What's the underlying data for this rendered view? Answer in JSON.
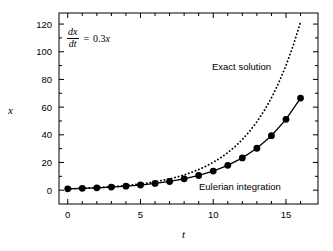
{
  "chart_data": {
    "type": "line",
    "title": "",
    "xlabel": "t",
    "ylabel": "x",
    "xlim": [
      -0.6,
      17.2
    ],
    "ylim": [
      -10,
      128
    ],
    "xticks": [
      0,
      5,
      10,
      15
    ],
    "yticks": [
      0,
      20,
      40,
      60,
      80,
      100,
      120
    ],
    "xtick_labels": [
      "0",
      "5",
      "10",
      "15"
    ],
    "ytick_labels": [
      "0",
      "20",
      "40",
      "60",
      "80",
      "100",
      "120"
    ],
    "xminor_step": 1,
    "yminor_step": 10,
    "grid": false,
    "legend_position": "inline-annotations",
    "equation": {
      "numerator": "dx",
      "denominator": "dt",
      "equals": "=",
      "rhs_coefficient": "0.3",
      "rhs_variable": "x",
      "full_text": "dx/dt = 0.3x"
    },
    "annotations": [
      {
        "name": "exact-solution",
        "text": "Exact solution",
        "x_data": 12.0,
        "y_data": 96
      },
      {
        "name": "eulerian-integration",
        "text": "Eulerian integration",
        "x_data": 10.6,
        "y_data": 8
      }
    ],
    "series": [
      {
        "name": "Eulerian integration",
        "style": "solid-line-with-filled-circle-markers",
        "color": "#000000",
        "x": [
          0,
          1,
          2,
          3,
          4,
          5,
          6,
          7,
          8,
          9,
          10,
          11,
          12,
          13,
          14,
          15,
          16
        ],
        "values": [
          1.0,
          1.3,
          1.69,
          2.2,
          2.86,
          3.71,
          4.83,
          6.27,
          8.16,
          10.6,
          13.79,
          17.92,
          23.3,
          30.29,
          39.37,
          51.19,
          66.54
        ]
      },
      {
        "name": "Exact solution",
        "style": "dotted-line",
        "color": "#000000",
        "x": [
          0,
          0.5,
          1,
          1.5,
          2,
          2.5,
          3,
          3.5,
          4,
          4.5,
          5,
          5.5,
          6,
          6.5,
          7,
          7.5,
          8,
          8.5,
          9,
          9.5,
          10,
          10.5,
          11,
          11.5,
          12,
          12.5,
          13,
          13.5,
          14,
          14.5,
          15,
          15.5,
          16
        ],
        "values": [
          1.0,
          1.16,
          1.35,
          1.57,
          1.82,
          2.12,
          2.46,
          2.86,
          3.32,
          3.86,
          4.48,
          5.21,
          6.05,
          7.03,
          8.17,
          9.49,
          11.02,
          12.81,
          14.88,
          17.29,
          20.09,
          23.34,
          27.11,
          31.5,
          36.6,
          42.52,
          49.4,
          57.4,
          66.69,
          77.48,
          90.02,
          104.58,
          121.51
        ]
      }
    ]
  }
}
